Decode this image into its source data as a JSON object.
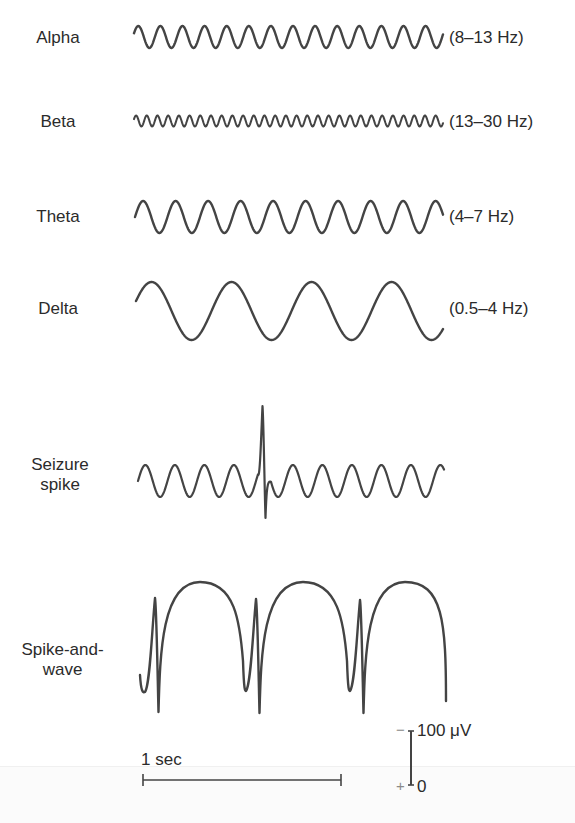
{
  "figure": {
    "stroke_color": "#444444"
  },
  "rhythms": [
    {
      "name": "Alpha",
      "freq_label": "(8–13 Hz)",
      "label_y": 28,
      "freq_y": 28,
      "wave": {
        "type": "sine",
        "x0": 134,
        "x1": 443,
        "ymid": 37,
        "amp": 11,
        "period": 22.1,
        "phase_deg": 200,
        "stroke": 2.4
      }
    },
    {
      "name": "Beta",
      "freq_label": "(13–30 Hz)",
      "label_y": 112,
      "freq_y": 112,
      "wave": {
        "type": "sine",
        "x0": 134,
        "x1": 443,
        "ymid": 121,
        "amp": 5.5,
        "period": 10.7,
        "phase_deg": 200,
        "stroke": 2.0
      }
    },
    {
      "name": "Theta",
      "freq_label": "(4–7 Hz)",
      "label_y": 207,
      "freq_y": 207,
      "wave": {
        "type": "sine",
        "x0": 135,
        "x1": 443,
        "ymid": 217,
        "amp": 16,
        "period": 32.5,
        "phase_deg": 180,
        "stroke": 2.4
      }
    },
    {
      "name": "Delta",
      "freq_label": "(0.5–4 Hz)",
      "label_y": 299,
      "freq_y": 299,
      "wave": {
        "type": "sine",
        "x0": 136,
        "x1": 443,
        "ymid": 311,
        "amp": 29,
        "period": 80,
        "phase_deg": 200,
        "stroke": 2.4
      }
    }
  ],
  "seizure": {
    "name_line1": "Seizure",
    "name_line2": "spike",
    "label_y": 455,
    "wave": {
      "x0": 138,
      "x1": 444,
      "ymid": 481,
      "amp": 16,
      "period": 29.5,
      "phase_deg": 180,
      "stroke": 2.2,
      "spike_x": 263,
      "spike_top": 406,
      "spike_bottom": 518
    }
  },
  "spike_and_wave": {
    "name_line1": "Spike-and-",
    "name_line2": "wave",
    "label_y": 640,
    "stroke": 2.4,
    "start": {
      "x": 140,
      "y": 675
    },
    "complexes": [
      {
        "trough_x": 145,
        "trough_y": 692,
        "spike_x": 155,
        "spike_top": 598,
        "spike_bottom": 712,
        "dome_top": 582,
        "dome_x": 200
      },
      {
        "trough_x": 246,
        "trough_y": 691,
        "spike_x": 256,
        "spike_top": 599,
        "spike_bottom": 713,
        "dome_top": 582,
        "dome_x": 303
      },
      {
        "trough_x": 350,
        "trough_y": 691,
        "spike_x": 360,
        "spike_top": 600,
        "spike_bottom": 713,
        "dome_top": 582,
        "dome_x": 405
      }
    ],
    "end": {
      "x": 446,
      "y": 701
    }
  },
  "scale_bars": {
    "time": {
      "label": "1 sec",
      "x0": 143,
      "x1": 341,
      "y": 780
    },
    "voltage": {
      "label_top": "100 μV",
      "label_bottom": "0",
      "minus": "−",
      "plus": "+",
      "x": 411,
      "y_top": 731,
      "y_bottom": 785
    }
  }
}
